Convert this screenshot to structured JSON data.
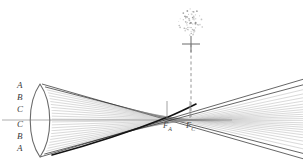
{
  "figure": {
    "background_color": "#ffffff",
    "width": 304,
    "height": 165
  },
  "zone_labels": [
    {
      "text": "A",
      "x": 17,
      "y": 86
    },
    {
      "text": "B",
      "x": 17,
      "y": 98
    },
    {
      "text": "C",
      "x": 17,
      "y": 110
    },
    {
      "text": "C",
      "x": 17,
      "y": 124
    },
    {
      "text": "B",
      "x": 17,
      "y": 136
    },
    {
      "text": "A",
      "x": 17,
      "y": 148
    }
  ],
  "focus_labels": [
    {
      "text": "F",
      "sub": "A",
      "x": 163,
      "y": 126,
      "tick_x": 167,
      "tick_top": 101,
      "tick_bottom": 118
    },
    {
      "text": "F",
      "sub": "C",
      "x": 186,
      "y": 126,
      "tick_x": 190,
      "tick_top": 101,
      "tick_bottom": 118
    }
  ],
  "optical_axis": {
    "y": 120,
    "x_start": 2,
    "x_end": 232,
    "color": "#9a9a9a"
  },
  "lens": {
    "center_x": 40,
    "top_y": 84,
    "bottom_y": 157,
    "bulge": 12,
    "color": "#6b6b6b"
  },
  "blur_spot": {
    "center_x": 191,
    "center_y": 22,
    "radius": 13,
    "dot_count": 70,
    "color": "#8a8a8a"
  },
  "screen_marker": {
    "x": 191,
    "y": 44,
    "arm": 9,
    "color": "#6b6b6b"
  },
  "dashed_line": {
    "x": 191,
    "y_start": 44,
    "y_end": 118,
    "color": "#8a8a8a"
  },
  "ray_bundle": {
    "count": 26,
    "color_light": "#8c8c8c",
    "color_dark": "#2a2a2a",
    "caustic_color": "#111111"
  },
  "chart_data": {
    "type": "line",
    "xlabel": "",
    "ylabel": "",
    "annotations": [
      "A",
      "B",
      "C",
      "C",
      "B",
      "A",
      "F_A",
      "F_C"
    ],
    "series": [
      {
        "name": "marginal-rays-zone-A",
        "note": "outermost rays, focus nearest lens at F_A"
      },
      {
        "name": "mid-rays-zone-B",
        "note": "intermediate rays focus between F_A and F_C"
      },
      {
        "name": "paraxial-rays-zone-C",
        "note": "rays near axis focus farthest at F_C"
      }
    ]
  }
}
